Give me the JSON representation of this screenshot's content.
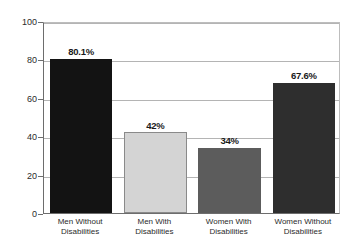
{
  "chart_data": {
    "type": "bar",
    "title": "",
    "subtitle": "",
    "xlabel": "",
    "ylabel": "",
    "ylim": [
      0,
      100
    ],
    "yticks": [
      0,
      20,
      40,
      60,
      80,
      100
    ],
    "ytick_labels": [
      "0",
      "20",
      "40",
      "60",
      "80",
      "100"
    ],
    "grid": "horizontal",
    "legend": "none",
    "categories": [
      "Men Without\nDisabilities",
      "Men With\nDisabilities",
      "Women With\nDisabilities",
      "Women Without\nDisabilities"
    ],
    "values": [
      80.1,
      42,
      34,
      67.6
    ],
    "value_labels": [
      "80.1%",
      "42%",
      "34%",
      "67.6%"
    ],
    "bar_colors": [
      "#131313",
      "#d4d4d4",
      "#5c5c5c",
      "#2e2e2e"
    ]
  },
  "axis_colors": {
    "axis_line": "#6d6d6d",
    "gridline": "#b4b4b4",
    "frame": "#bdbdbd",
    "background": "#ffffff",
    "text": "#2b2b2b"
  }
}
